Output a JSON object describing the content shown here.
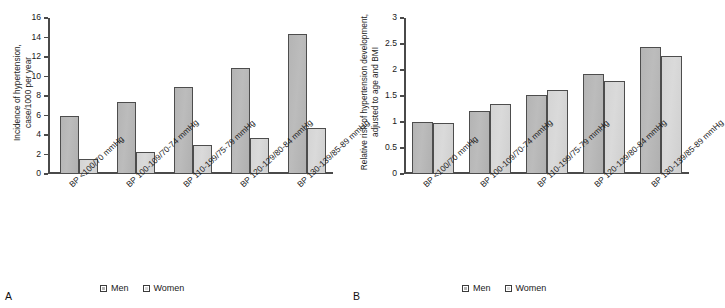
{
  "figure": {
    "panels": [
      {
        "letter": "A",
        "ylabel_line1": "Incidence of hypertension,",
        "ylabel_line2": "case/1000 per year",
        "legend": [
          {
            "label": "Men",
            "swatch": "men-swatch",
            "color": "#b4b4b4"
          },
          {
            "label": "Women",
            "swatch": "women-swatch",
            "color": "#d8d8d8"
          }
        ]
      },
      {
        "letter": "B",
        "ylabel_line1": "Relative risk of hypertension development,",
        "ylabel_line2": "adjusted to age and BMI",
        "legend": [
          {
            "label": "Men",
            "swatch": "men-swatch",
            "color": "#b4b4b4"
          },
          {
            "label": "Women",
            "swatch": "women-swatch",
            "color": "#d8d8d8"
          }
        ]
      }
    ]
  },
  "chart_data": [
    {
      "type": "bar",
      "panel": "A",
      "title": "",
      "xlabel": "",
      "ylabel": "Incidence of hypertension, case/1000 per year",
      "ylim": [
        0,
        16
      ],
      "yticks": [
        0,
        2,
        4,
        6,
        8,
        10,
        12,
        14,
        16
      ],
      "ytick_labels": [
        "0",
        "2",
        "4",
        "6",
        "8",
        "10",
        "12",
        "14",
        "16"
      ],
      "grid": false,
      "legend_position": "bottom-center",
      "categories": [
        "BP <100/70 mmHg",
        "BP 100-109/70-74 mmHg",
        "BP 110-199/75-79 mmHg",
        "BP 120-129/80-84 mmHg",
        "BP 130-139/85-89 mmHg"
      ],
      "series": [
        {
          "name": "Men",
          "color": "#b4b4b4",
          "values": [
            5.9,
            7.4,
            8.9,
            10.9,
            14.4
          ]
        },
        {
          "name": "Women",
          "color": "#d8d8d8",
          "values": [
            1.5,
            2.3,
            3.0,
            3.65,
            4.75
          ]
        }
      ]
    },
    {
      "type": "bar",
      "panel": "B",
      "title": "",
      "xlabel": "",
      "ylabel": "Relative risk of hypertension development, adjusted to age and BMI",
      "ylim": [
        0,
        3
      ],
      "yticks": [
        0,
        0.5,
        1,
        1.5,
        2,
        2.5,
        3
      ],
      "ytick_labels": [
        "0",
        "0.5",
        "1",
        "1.5",
        "2",
        "2.5",
        "3"
      ],
      "grid": false,
      "legend_position": "bottom-center",
      "categories": [
        "BP <100/70 mmHg",
        "BP 100-109/70-74 mmHg",
        "BP 110-199/75-79 mmHg",
        "BP 120-129/80-84 mmHg",
        "BP 130-139/85-89 mmHg"
      ],
      "series": [
        {
          "name": "Men",
          "color": "#b4b4b4",
          "values": [
            1.0,
            1.21,
            1.51,
            1.92,
            2.45
          ]
        },
        {
          "name": "Women",
          "color": "#d8d8d8",
          "values": [
            0.99,
            1.34,
            1.61,
            1.79,
            2.27
          ]
        }
      ]
    }
  ]
}
